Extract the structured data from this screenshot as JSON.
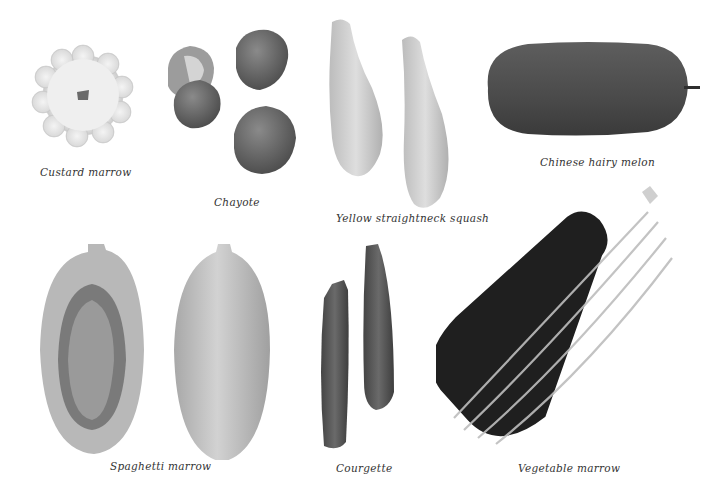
{
  "page": {
    "background": "#ffffff",
    "style": "grayscale vegetable identification plate"
  },
  "specimens": [
    {
      "id": "custard-marrow",
      "caption": "Custard marrow",
      "count": 1,
      "tone": "#e8e8e8"
    },
    {
      "id": "chayote",
      "caption": "Chayote",
      "count": 4,
      "tone": "#6e6e6e"
    },
    {
      "id": "yellow-straightneck-squash",
      "caption": "Yellow straightneck squash",
      "count": 2,
      "tone": "#cfcfcf"
    },
    {
      "id": "chinese-hairy-melon",
      "caption": "Chinese hairy melon",
      "count": 1,
      "tone": "#505050"
    },
    {
      "id": "spaghetti-marrow",
      "caption": "Spaghetti marrow",
      "count": 2,
      "tone": "#b5b5b5"
    },
    {
      "id": "courgette",
      "caption": "Courgette",
      "count": 2,
      "tone": "#5a5a5a"
    },
    {
      "id": "vegetable-marrow",
      "caption": "Vegetable marrow",
      "count": 1,
      "tone": "#1e1e1e"
    }
  ]
}
